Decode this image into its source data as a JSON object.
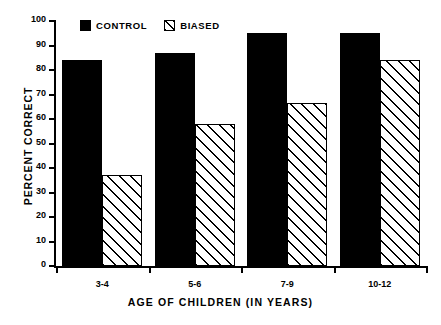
{
  "chart_data": {
    "type": "bar",
    "title": "",
    "xlabel": "AGE OF CHILDREN (IN YEARS)",
    "ylabel": "PERCENT CORRECT",
    "categories": [
      "3-4",
      "5-6",
      "7-9",
      "10-12"
    ],
    "series": [
      {
        "name": "CONTROL",
        "values": [
          84,
          87,
          95,
          95
        ],
        "color": "#000000",
        "fill": "solid"
      },
      {
        "name": "BIASED",
        "values": [
          37,
          58,
          66.5,
          84
        ],
        "color": "#000000",
        "fill": "diagonal-hatch"
      }
    ],
    "ylim": [
      0,
      100
    ],
    "yticks": [
      0,
      10,
      20,
      30,
      40,
      50,
      60,
      70,
      80,
      90,
      100
    ],
    "ytick_labels": [
      "0",
      "10",
      "20",
      "30",
      "40",
      "50",
      "60",
      "70",
      "80",
      "90",
      "100"
    ],
    "grid": false,
    "legend_position": "top-left-inside",
    "legend_entries": [
      "CONTROL",
      "BIASED"
    ],
    "annotations": []
  }
}
